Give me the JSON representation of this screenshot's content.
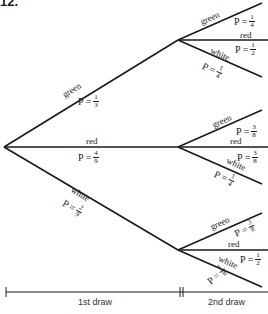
{
  "problem_number": "12.",
  "first_draw": {
    "green": {
      "label": "green",
      "p_prefix": "P =",
      "num": "1",
      "den": "3"
    },
    "red": {
      "label": "red",
      "p_prefix": "P =",
      "num": "4",
      "den": "9"
    },
    "white": {
      "label": "white",
      "p_prefix": "P =",
      "num": "2",
      "den": "9"
    }
  },
  "second_draw": {
    "after_green": {
      "green": {
        "label": "green",
        "p_prefix": "P =",
        "num": "1",
        "den": "4"
      },
      "red": {
        "label": "red",
        "p_prefix": "P =",
        "num": "1",
        "den": "2"
      },
      "white": {
        "label": "white",
        "p_prefix": "P =",
        "num": "1",
        "den": "4"
      }
    },
    "after_red": {
      "green": {
        "label": "green",
        "p_prefix": "P =",
        "num": "3",
        "den": "8"
      },
      "red": {
        "label": "red",
        "p_prefix": "P =",
        "num": "3",
        "den": "8"
      },
      "white": {
        "label": "white",
        "p_prefix": "P =",
        "num": "1",
        "den": "4"
      }
    },
    "after_white": {
      "green": {
        "label": "green",
        "p_prefix": "P =",
        "num": "3",
        "den": "8"
      },
      "red": {
        "label": "red",
        "p_prefix": "P =",
        "num": "1",
        "den": "2"
      },
      "white": {
        "label": "white",
        "p_prefix": "P =",
        "num": "1",
        "den": "8"
      }
    }
  },
  "axis": {
    "first_label": "1st draw",
    "second_label": "2nd draw"
  },
  "colors": {
    "line": "#1a1a1a",
    "background": "#ffffff"
  }
}
